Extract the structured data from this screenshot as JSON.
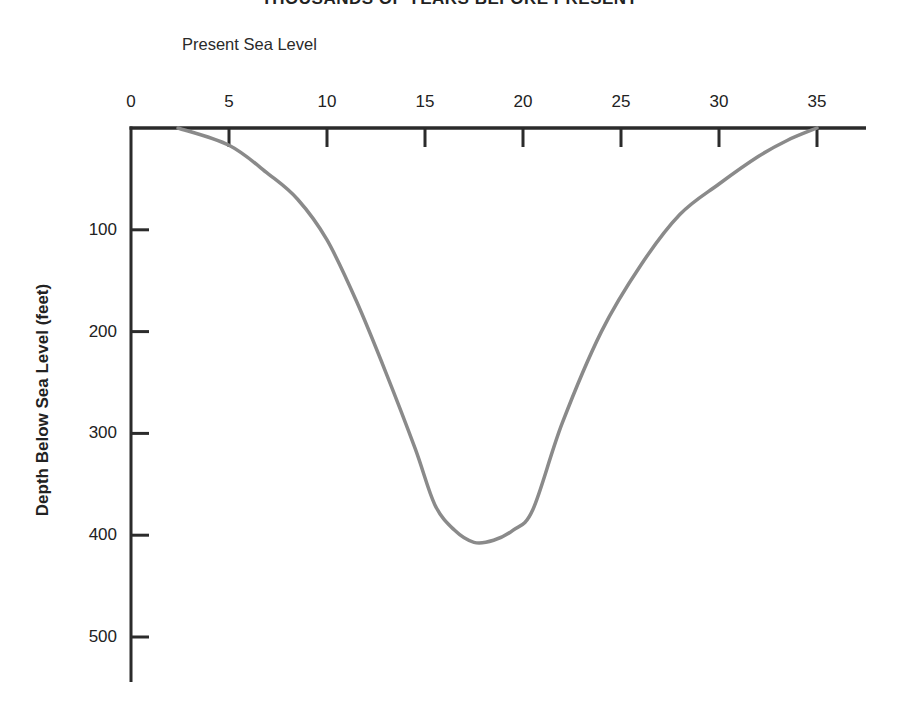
{
  "chart_data": {
    "type": "line",
    "title": "THOUSANDS OF YEARS BEFORE PRESENT",
    "annotation": "Present Sea Level",
    "xlabel": "Thousands of Years Before Present",
    "ylabel": "Depth Below Sea Level (feet)",
    "x_ticks": [
      "0",
      "5",
      "10",
      "15",
      "20",
      "25",
      "30",
      "35"
    ],
    "y_ticks": [
      "100",
      "200",
      "300",
      "400",
      "500"
    ],
    "xlim": [
      0,
      37
    ],
    "ylim": [
      0,
      540
    ],
    "y_inverted": true,
    "grid": false,
    "legend": null,
    "series": [
      {
        "name": "Sea level depth",
        "color": "#8a8a8a",
        "x": [
          2.4,
          5,
          7,
          8.5,
          10,
          11.5,
          13,
          14.5,
          15.5,
          16.5,
          17.5,
          18.5,
          19.5,
          20.5,
          22,
          24,
          26,
          28,
          30,
          32,
          33.5,
          35
        ],
        "y": [
          0,
          17,
          45,
          70,
          110,
          170,
          240,
          315,
          370,
          395,
          407,
          405,
          395,
          375,
          290,
          200,
          135,
          85,
          55,
          28,
          12,
          0
        ]
      }
    ]
  },
  "labels": {
    "title": "THOUSANDS OF YEARS BEFORE PRESENT",
    "present": "Present Sea Level",
    "ylabel": "Depth Below Sea Level (feet)"
  }
}
